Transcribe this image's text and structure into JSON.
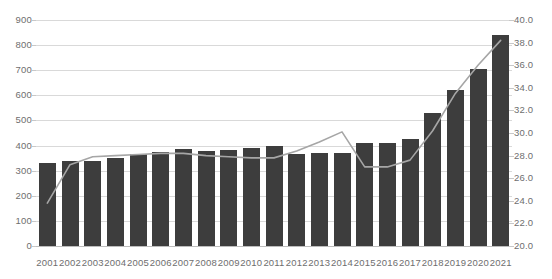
{
  "chart_data": {
    "type": "bar",
    "title": "",
    "subtitle": "",
    "xlabel": "",
    "ylabel": "",
    "grid": true,
    "legend": "none",
    "categories": [
      "2001",
      "2002",
      "2003",
      "2004",
      "2005",
      "2006",
      "2007",
      "2008",
      "2009",
      "2010",
      "2011",
      "2012",
      "2013",
      "2014",
      "2015",
      "2016",
      "2017",
      "2018",
      "2019",
      "2020",
      "2021"
    ],
    "series": [
      {
        "name": "bars",
        "type": "bar",
        "axis": "left",
        "color": "#3d3d3d",
        "values": [
          330,
          338,
          340,
          352,
          368,
          375,
          385,
          380,
          382,
          390,
          400,
          368,
          372,
          372,
          410,
          410,
          425,
          530,
          620,
          705,
          840
        ]
      },
      {
        "name": "line",
        "type": "line",
        "axis": "right",
        "color": "#a6a6a6",
        "values": [
          23.8,
          27.2,
          27.9,
          28.0,
          28.1,
          28.2,
          28.2,
          28.0,
          27.9,
          27.8,
          27.8,
          28.4,
          29.2,
          30.1,
          27.0,
          27.0,
          27.6,
          30.2,
          33.5,
          36.0,
          38.2
        ]
      }
    ],
    "left_axis": {
      "min": 0,
      "max": 900,
      "step": 100,
      "ticks": [
        "0",
        "100",
        "200",
        "300",
        "400",
        "500",
        "600",
        "700",
        "800",
        "900"
      ]
    },
    "right_axis": {
      "min": 20.0,
      "max": 40.0,
      "step": 2.0,
      "ticks": [
        "20.0",
        "22.0",
        "24.0",
        "26.0",
        "28.0",
        "30.0",
        "32.0",
        "34.0",
        "36.0",
        "38.0",
        "40.0"
      ]
    },
    "colors": {
      "bar": "#3d3d3d",
      "line": "#a6a6a6",
      "grid": "#d9d9d9",
      "text": "#6e6e6e",
      "background": "#ffffff"
    }
  }
}
